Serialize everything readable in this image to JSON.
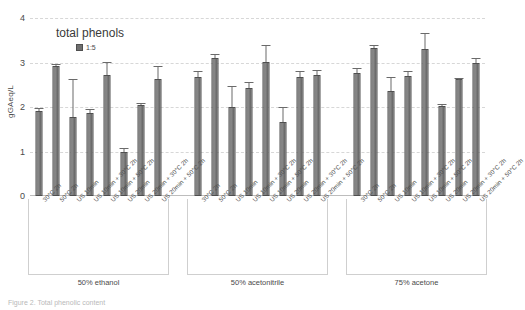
{
  "chart_data": {
    "type": "bar",
    "title": "total phenols",
    "xlabel": "",
    "ylabel": "gGAeq/L",
    "ylim": [
      0,
      4
    ],
    "yticks": [
      0,
      1,
      2,
      3,
      4
    ],
    "grid": true,
    "legend_position": "top-center",
    "series": [
      {
        "name": "1:5",
        "color": "#707070",
        "values": [
          1.9,
          2.93,
          1.78,
          1.87,
          2.72,
          0.98,
          2.04,
          2.63,
          2.68,
          3.11,
          2.0,
          2.43,
          3.02,
          1.67,
          2.68,
          2.72,
          2.76,
          3.32,
          2.37,
          2.7,
          3.3,
          2.02,
          2.62,
          3.0
        ],
        "errors": [
          0.06,
          0.02,
          0.83,
          0.06,
          0.26,
          0.08,
          0.02,
          0.28,
          0.1,
          0.06,
          0.45,
          0.12,
          0.35,
          0.3,
          0.1,
          0.08,
          0.09,
          0.05,
          0.28,
          0.09,
          0.33,
          0.02,
          0.02,
          0.08
        ]
      }
    ],
    "categories": [
      "30°C 2h",
      "50°C 2h",
      "US 10min",
      "US 10min + 30°C 2h",
      "US 10min + 50°C 2h",
      "US 20min",
      "US 20min + 30°C 2h",
      "US 20min + 50°C 2h",
      "30°C 2h",
      "50°C 2h",
      "US 10min",
      "US 10min + 30°C 2h",
      "US 10min + 50°C 2h",
      "US 20min",
      "US 20min + 30°C 2h",
      "US 20min + 50°C 2h",
      "30°C 2h",
      "50°C 2h",
      "US 10min",
      "US 10min + 30°C 2h",
      "US 10min + 50°C 2h",
      "US 20min",
      "US 20min + 30°C 2h",
      "US 20min + 50°C 2h"
    ],
    "groups": [
      {
        "label": "50% ethanol",
        "count": 8
      },
      {
        "label": "50% acetonitrile",
        "count": 8
      },
      {
        "label": "75% acetone",
        "count": 8
      }
    ]
  },
  "legend": {
    "entries": [
      {
        "label": "1:5"
      }
    ]
  },
  "caption": {
    "text": "Figure 2.  Total phenolic content"
  }
}
